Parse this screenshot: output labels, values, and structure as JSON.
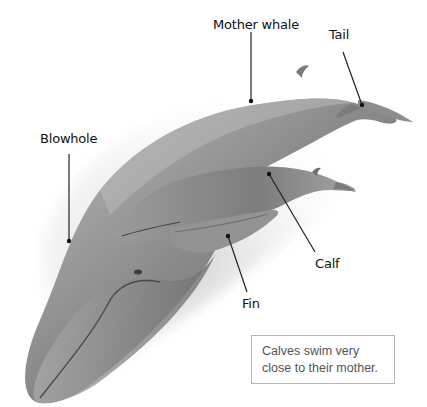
{
  "diagram": {
    "title_fragment": "",
    "labels": {
      "mother_whale": "Mother whale",
      "tail": "Tail",
      "blowhole": "Blowhole",
      "calf": "Calf",
      "fin": "Fin"
    },
    "caption": {
      "line1": "Calves swim very",
      "line2": "close to their mother."
    },
    "colors": {
      "whale_dark": "#5a5a5a",
      "whale_mid": "#8a8a8a",
      "whale_light": "#cfcfcf",
      "leader_line": "#222222",
      "caption_border": "#b5b5b5",
      "caption_text": "#555555"
    }
  }
}
